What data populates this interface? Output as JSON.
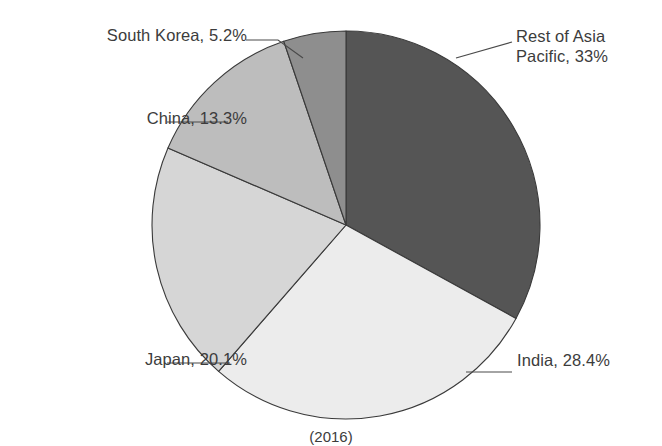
{
  "chart_data": {
    "type": "pie",
    "title": "",
    "subtitle": "",
    "xlabel": "",
    "ylabel": "",
    "legend_position": "none",
    "grid": false,
    "start_angle_deg": 0,
    "direction": "clockwise",
    "units": "percent",
    "categories": [
      "Rest of Asia Pacific",
      "India",
      "Japan",
      "China",
      "South Korea"
    ],
    "values": [
      33,
      28.4,
      20.1,
      13.3,
      5.2
    ],
    "labels": [
      "Rest of Asia Pacific, 33%",
      "India, 28.4%",
      "Japan, 20.1%",
      "China, 13.3%",
      "South Korea, 5.2%"
    ],
    "colors": [
      "#555555",
      "#ececec",
      "#d6d6d6",
      "#bdbdbd",
      "#8e8e8e"
    ],
    "slices": [
      {
        "name": "Rest of Asia Pacific",
        "label": "Rest of Asia\nPacific, 33%",
        "value": 33,
        "value_text": "33%",
        "color": "#555555",
        "start_deg": 0,
        "end_deg": 118.8,
        "label_side": "right"
      },
      {
        "name": "India",
        "label": "India, 28.4%",
        "value": 28.4,
        "value_text": "28.4%",
        "color": "#ececec",
        "start_deg": 118.8,
        "end_deg": 221.04,
        "label_side": "right"
      },
      {
        "name": "Japan",
        "label": "Japan, 20.1%",
        "value": 20.1,
        "value_text": "20.1%",
        "color": "#d6d6d6",
        "start_deg": 221.04,
        "end_deg": 293.4,
        "label_side": "left"
      },
      {
        "name": "China",
        "label": "China, 13.3%",
        "value": 13.3,
        "value_text": "13.3%",
        "color": "#bdbdbd",
        "start_deg": 293.4,
        "end_deg": 341.28,
        "label_side": "left"
      },
      {
        "name": "South Korea",
        "label": "South Korea, 5.2%",
        "value": 5.2,
        "value_text": "5.2%",
        "color": "#8e8e8e",
        "start_deg": 341.28,
        "end_deg": 360,
        "label_side": "left"
      }
    ],
    "caption": "(2016)"
  },
  "figure": {
    "background_color": "#ffffff",
    "outline_color": "#3a3a3a",
    "text_color": "#3c3c3c",
    "caption": "(2016)"
  }
}
